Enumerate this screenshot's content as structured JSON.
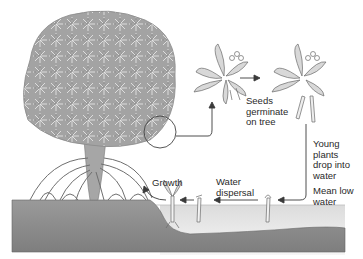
{
  "diagram": {
    "labels": {
      "seeds_germinate": "Seeds\ngerminate\non tree",
      "young_plants_drop": "Young\nplants\ndrop into\nwater",
      "mean_low_water": "Mean low\nwater",
      "water_dispersal": "Water\ndispersal",
      "growth": "Growth"
    },
    "colors": {
      "ground": "#8c8c8c",
      "ground_top": "#a8a8a8",
      "water": "#efefef",
      "canopy": "#9a9a9a",
      "line": "#3a3a3a",
      "text": "#2a2a2a"
    }
  }
}
